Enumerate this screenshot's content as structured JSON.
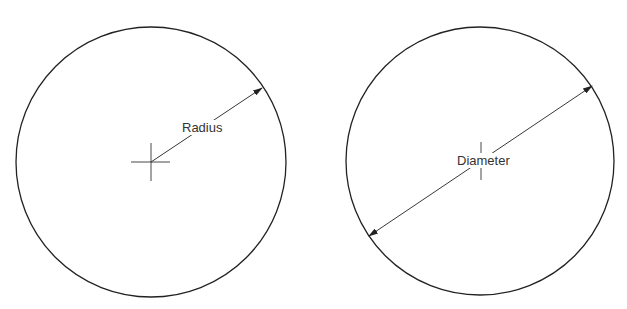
{
  "diagram": {
    "left": {
      "label": "Radius",
      "type": "radius"
    },
    "right": {
      "label": "Diameter",
      "type": "diameter"
    }
  }
}
